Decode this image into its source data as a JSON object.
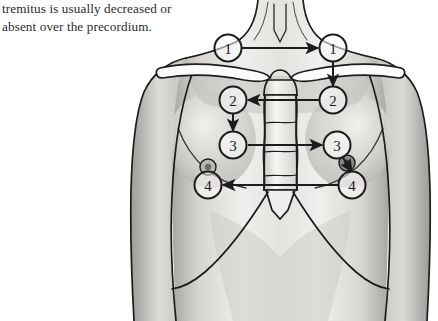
{
  "caption": {
    "text": "tremitus is usually decreased or\nabsent over the precordium."
  },
  "figure": {
    "name": "anterior-chest-palpation-sequence",
    "ink_color": "#1c1c1c",
    "skin_shade_light": "#f2f1ef",
    "skin_shade_mid": "#cfcdc9",
    "skin_shade_dark": "#9c9a96",
    "markers": [
      {
        "label": "1",
        "side": "left",
        "cx": 228,
        "cy": 48,
        "name": "marker-1-left"
      },
      {
        "label": "1",
        "side": "right",
        "cx": 333,
        "cy": 48,
        "name": "marker-1-right"
      },
      {
        "label": "2",
        "side": "left",
        "cx": 233,
        "cy": 100,
        "name": "marker-2-left"
      },
      {
        "label": "2",
        "side": "right",
        "cx": 333,
        "cy": 100,
        "name": "marker-2-right"
      },
      {
        "label": "3",
        "side": "left",
        "cx": 233,
        "cy": 145,
        "name": "marker-3-left"
      },
      {
        "label": "3",
        "side": "right",
        "cx": 337,
        "cy": 145,
        "name": "marker-3-right"
      },
      {
        "label": "4",
        "side": "left",
        "cx": 208,
        "cy": 185,
        "name": "marker-4-left"
      },
      {
        "label": "4",
        "side": "right",
        "cx": 352,
        "cy": 185,
        "name": "marker-4-right"
      }
    ],
    "arrows": [
      {
        "name": "arrow-1-left-to-right",
        "direction": "right"
      },
      {
        "name": "arrow-1-right-to-2-right",
        "direction": "down"
      },
      {
        "name": "arrow-2-right-to-left",
        "direction": "left"
      },
      {
        "name": "arrow-2-left-to-3-left",
        "direction": "down"
      },
      {
        "name": "arrow-3-left-to-right",
        "direction": "right"
      },
      {
        "name": "arrow-3-right-to-nipple",
        "direction": "down-right"
      },
      {
        "name": "arrow-4-right-to-left",
        "direction": "left"
      }
    ]
  }
}
